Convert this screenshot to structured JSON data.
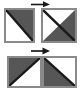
{
  "figure": {
    "colors": {
      "shaded_fill": "#565656",
      "empty_fill": "#ffffff",
      "tile_border": "#8a8a8a",
      "diagonal_line": "#1a1a1a",
      "arrow": "#1a1a1a",
      "background": "#ffffff"
    },
    "rows": [
      {
        "name": "input-row",
        "arrow_label": "→",
        "tiles": [
          {
            "name": "tile-top-left",
            "shaded_corner": "upper-right",
            "empty_corner": "lower-left",
            "diagonal": "bottom-left-to-top-right"
          },
          {
            "name": "tile-top-right",
            "shaded_corner": "lower-right",
            "empty_corner": "upper-left",
            "diagonal": "top-left-to-bottom-right"
          }
        ]
      },
      {
        "name": "output-row",
        "arrow_label": "→",
        "tiles": [
          {
            "name": "tile-bottom-left",
            "shaded_corner": "upper-left",
            "empty_corner": "lower-right",
            "diagonal": "top-left-to-bottom-right"
          },
          {
            "name": "tile-bottom-right",
            "shaded_corner": "lower-left",
            "empty_corner": "upper-right",
            "diagonal": "bottom-left-to-top-right"
          }
        ]
      }
    ]
  }
}
